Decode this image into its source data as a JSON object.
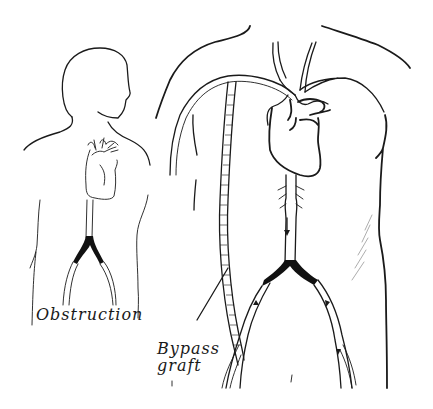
{
  "figure": {
    "colors": {
      "ink": "#1a1a1a",
      "background": "#ffffff",
      "obstruction_fill": "#111111"
    },
    "panels": [
      {
        "id": "small-figure",
        "description": "Side-profile figure with heart and aortic bifurcation showing obstruction"
      },
      {
        "id": "large-torso",
        "description": "Front torso with heart, aorta, and bypass graft routed from aortic arch to femoral artery"
      }
    ],
    "labels": {
      "obstruction": "Obstruction",
      "bypass_line1": "Bypass",
      "bypass_line2": "graft"
    }
  }
}
